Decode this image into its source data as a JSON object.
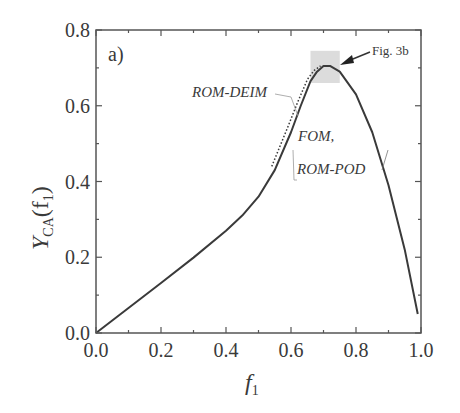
{
  "chart_data": {
    "type": "line",
    "panel_label": "a)",
    "title": "",
    "xlabel": "f1",
    "ylabel": "Y_CA(f1)",
    "xlim": [
      0.0,
      1.0
    ],
    "ylim": [
      0.0,
      0.8
    ],
    "x_ticks": [
      "0.0",
      "0.2",
      "0.4",
      "0.6",
      "0.8",
      "1.0"
    ],
    "y_ticks": [
      "0.0",
      "0.2",
      "0.4",
      "0.6",
      "0.8"
    ],
    "grid": false,
    "series": [
      {
        "name": "FOM, ROM-POD",
        "style": "solid",
        "x": [
          0.0,
          0.1,
          0.2,
          0.3,
          0.4,
          0.45,
          0.5,
          0.55,
          0.6,
          0.63,
          0.66,
          0.68,
          0.7,
          0.72,
          0.75,
          0.8,
          0.85,
          0.9,
          0.95,
          0.99
        ],
        "y": [
          0.0,
          0.066,
          0.132,
          0.199,
          0.27,
          0.31,
          0.36,
          0.43,
          0.53,
          0.6,
          0.665,
          0.69,
          0.705,
          0.705,
          0.69,
          0.63,
          0.53,
          0.39,
          0.22,
          0.05
        ]
      },
      {
        "name": "ROM-DEIM",
        "style": "dotted",
        "x": [
          0.55,
          0.6,
          0.63,
          0.66,
          0.68,
          0.7
        ],
        "y": [
          0.44,
          0.545,
          0.61,
          0.67,
          0.693,
          0.705
        ]
      }
    ],
    "annotations": [
      {
        "text": "ROM-DEIM",
        "x": 0.34,
        "y": 0.64
      },
      {
        "text": "FOM,",
        "x": 0.62,
        "y": 0.47
      },
      {
        "text": "ROM-POD",
        "x": 0.61,
        "y": 0.39
      },
      {
        "text": "Fig. 3b",
        "x": 0.8,
        "y": 0.735,
        "arrow_to": [
          0.74,
          0.705
        ]
      }
    ],
    "highlight_region": {
      "x": [
        0.66,
        0.75
      ],
      "y": [
        0.66,
        0.745
      ],
      "color": "#dcdcdc"
    }
  },
  "labels": {
    "panel": "a)",
    "rom_deim": "ROM-DEIM",
    "fom": "FOM,",
    "rom_pod": "ROM-POD",
    "fig_ref": "Fig. 3b",
    "xlabel_main": "f",
    "xlabel_sub": "1",
    "ylabel_main": "Y",
    "ylabel_sub": "CA",
    "ylabel_arg": "(f",
    "ylabel_arg_sub": "1",
    "ylabel_close": ")"
  }
}
